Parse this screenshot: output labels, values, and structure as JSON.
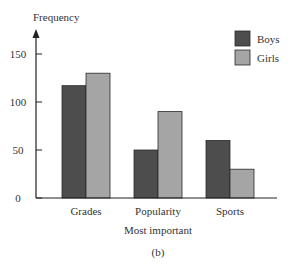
{
  "chart_data": {
    "type": "bar",
    "title": "",
    "xlabel": "Most important",
    "ylabel": "Frequency",
    "caption": "(b)",
    "categories": [
      "Grades",
      "Popularity",
      "Sports"
    ],
    "series": [
      {
        "name": "Boys",
        "values": [
          117,
          50,
          60
        ],
        "color": "#4d4d4d"
      },
      {
        "name": "Girls",
        "values": [
          130,
          90,
          30
        ],
        "color": "#a5a5a5"
      }
    ],
    "yticks": [
      0,
      50,
      100,
      150
    ],
    "ylim": [
      0,
      170
    ],
    "grid": false,
    "legend_position": "top-right"
  }
}
